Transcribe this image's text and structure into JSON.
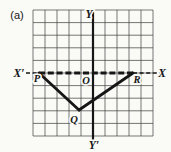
{
  "figure": {
    "part_label": "(a)",
    "colors": {
      "background": "#fafaf7",
      "ink": "#161616",
      "grid": "#3c3c3c",
      "halo": "#fafaf7"
    },
    "grid": {
      "left": 33,
      "top": 10,
      "cols": 10,
      "rows": 10,
      "cell_w": 12,
      "cell_h": 12.6,
      "line_width": 0.7
    },
    "x_axis": {
      "y": 73,
      "label_left": "X′",
      "label_right": "X",
      "segments": [
        {
          "name": "x-axis-left-dash",
          "x1": 26,
          "x2": 39,
          "width": 1.6,
          "dash": "4 2.6"
        },
        {
          "name": "x-axis-side-pr",
          "x1": 39,
          "x2": 133,
          "width": 2.8,
          "dash": "6 2.8"
        },
        {
          "name": "x-axis-right-dash",
          "x1": 133,
          "x2": 161,
          "width": 1.6,
          "dash": "4 2.6"
        }
      ]
    },
    "y_axis": {
      "x": 93,
      "y1": 10,
      "y2": 141,
      "width": 2.2,
      "label_top": "Y",
      "label_bottom": "Y′"
    },
    "origin_label": "O",
    "triangle": {
      "stroke_width": 2.8,
      "vertices": {
        "P": [
          39,
          73
        ],
        "Q": [
          79,
          110
        ],
        "R": [
          133,
          73
        ]
      },
      "solid_sides": [
        [
          "P",
          "Q"
        ],
        [
          "Q",
          "R"
        ]
      ],
      "dashed_side": [
        "P",
        "R"
      ]
    },
    "labels": [
      {
        "name": "figure-part-label",
        "text": "(a)",
        "x": 17,
        "y": 19,
        "size": 11,
        "style": "roman"
      },
      {
        "name": "label-y-top",
        "text": "Y",
        "x": 89,
        "y": 18,
        "size": 11.5,
        "style": "italic"
      },
      {
        "name": "label-x-left",
        "text": "X′",
        "x": 19,
        "y": 77,
        "size": 11.5,
        "style": "italic"
      },
      {
        "name": "label-x-right",
        "text": "X",
        "x": 162,
        "y": 77,
        "size": 11.5,
        "style": "italic"
      },
      {
        "name": "label-origin",
        "text": "O",
        "x": 86,
        "y": 84,
        "size": 10.5,
        "style": "italic"
      },
      {
        "name": "label-vertex-p",
        "text": "P",
        "x": 37,
        "y": 82,
        "size": 10.5,
        "style": "italic"
      },
      {
        "name": "label-vertex-r",
        "text": "R",
        "x": 137,
        "y": 83,
        "size": 10.5,
        "style": "italic"
      },
      {
        "name": "label-vertex-q",
        "text": "Q",
        "x": 74,
        "y": 123,
        "size": 10.5,
        "style": "italic"
      },
      {
        "name": "label-y-bottom",
        "text": "Y′",
        "x": 94,
        "y": 149,
        "size": 11.5,
        "style": "italic"
      }
    ]
  }
}
